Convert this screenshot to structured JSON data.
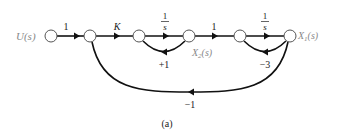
{
  "diagram": {
    "type": "signal-flow-graph",
    "caption": "(a)",
    "nodes": [
      {
        "id": "n0",
        "label": "U(s)",
        "x": 51,
        "y": 36
      },
      {
        "id": "n1",
        "label": "",
        "x": 90,
        "y": 36
      },
      {
        "id": "n2",
        "label": "",
        "x": 139,
        "y": 36
      },
      {
        "id": "n3",
        "label": "X2(s)",
        "x": 189,
        "y": 36
      },
      {
        "id": "n4",
        "label": "",
        "x": 240,
        "y": 36
      },
      {
        "id": "n5",
        "label": "X1(s)",
        "x": 290,
        "y": 36
      }
    ],
    "edges": {
      "e01": {
        "from": "n0",
        "to": "n1",
        "gain": "1"
      },
      "e12": {
        "from": "n1",
        "to": "n2",
        "gain": "K"
      },
      "e23": {
        "from": "n2",
        "to": "n3",
        "gain_num": "1",
        "gain_den": "s"
      },
      "e34": {
        "from": "n3",
        "to": "n4",
        "gain": "1"
      },
      "e45": {
        "from": "n4",
        "to": "n5",
        "gain_num": "1",
        "gain_den": "s"
      },
      "fb32": {
        "from": "n3",
        "to": "n2",
        "gain": "+1"
      },
      "fb54": {
        "from": "n5",
        "to": "n4",
        "gain": "−3"
      },
      "fb51": {
        "from": "n5",
        "to": "n1",
        "gain": "−1"
      }
    },
    "labels": {
      "u": "U(s)",
      "x2_main": "X",
      "x2_sub": "2",
      "x2_arg": "(s)",
      "x1_main": "X",
      "x1_sub": "1",
      "x1_arg": "(s)"
    }
  }
}
